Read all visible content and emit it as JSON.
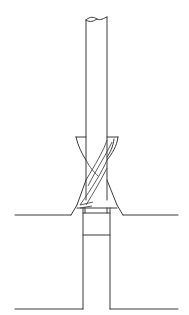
{
  "figure": {
    "title": "Countersink cutter with pilot entering a drilled hole",
    "components": [
      {
        "id": "shank",
        "label": "Cutter shank (broken-off top)"
      },
      {
        "id": "countersink-cone",
        "label": "Conical cutting head with helical flutes"
      },
      {
        "id": "pilot",
        "label": "Pilot inside bore"
      },
      {
        "id": "workpiece",
        "label": "Workpiece with countersunk bore"
      }
    ],
    "colors": {
      "background": "#ffffff",
      "line": "#3a3a3a"
    }
  }
}
